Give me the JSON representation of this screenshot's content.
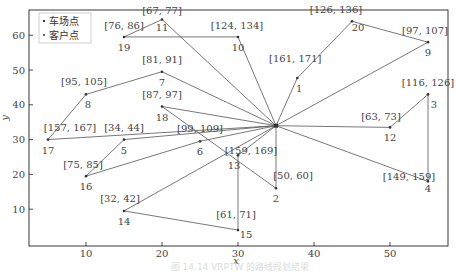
{
  "chart_data": {
    "type": "scatter",
    "subtype": "vehicle-routing-plot",
    "title": "",
    "xlabel": "x",
    "ylabel": "y",
    "xlim": [
      0,
      57
    ],
    "ylim": [
      2,
      67
    ],
    "xticks": [
      10,
      20,
      30,
      40,
      50
    ],
    "yticks": [
      10,
      20,
      30,
      40,
      50,
      60
    ],
    "grid": false,
    "legend_position": "upper-left",
    "legend": [
      {
        "label": "车场点",
        "marker": "square"
      },
      {
        "label": "客户点",
        "marker": "dot"
      }
    ],
    "depot": {
      "id": "depot",
      "x": 35,
      "y": 34
    },
    "customers": [
      {
        "id": "1",
        "x": 37.8,
        "y": 47.7,
        "tw": "[161, 171]"
      },
      {
        "id": "2",
        "x": 35,
        "y": 16,
        "tw": "[50, 60]"
      },
      {
        "id": "3",
        "x": 55,
        "y": 43,
        "tw": "[116, 126]"
      },
      {
        "id": "4",
        "x": 55,
        "y": 18,
        "tw": "[149, 159]"
      },
      {
        "id": "5",
        "x": 15,
        "y": 30,
        "tw": "[34, 44]"
      },
      {
        "id": "6",
        "x": 25,
        "y": 29.5,
        "tw": "[99, 109]"
      },
      {
        "id": "7",
        "x": 20,
        "y": 49.5,
        "tw": "[81, 91]"
      },
      {
        "id": "8",
        "x": 10,
        "y": 43,
        "tw": "[95, 105]"
      },
      {
        "id": "9",
        "x": 55,
        "y": 58,
        "tw": "[97, 107]"
      },
      {
        "id": "10",
        "x": 30,
        "y": 59.5,
        "tw": "[124, 134]"
      },
      {
        "id": "11",
        "x": 20,
        "y": 64.5,
        "tw": "[67, 77]"
      },
      {
        "id": "12",
        "x": 50,
        "y": 33.5,
        "tw": "[63, 73]"
      },
      {
        "id": "13",
        "x": 30,
        "y": 25.5,
        "tw": "[159, 169]"
      },
      {
        "id": "14",
        "x": 15,
        "y": 9.5,
        "tw": "[32, 42]"
      },
      {
        "id": "15",
        "x": 30,
        "y": 4,
        "tw": "[61, 71]"
      },
      {
        "id": "16",
        "x": 10,
        "y": 19.5,
        "tw": "[75, 85]"
      },
      {
        "id": "17",
        "x": 5,
        "y": 30,
        "tw": "[157, 167]"
      },
      {
        "id": "18",
        "x": 20,
        "y": 39.5,
        "tw": "[87, 97]"
      },
      {
        "id": "19",
        "x": 15,
        "y": 59.5,
        "tw": "[76, 86]"
      },
      {
        "id": "20",
        "x": 45,
        "y": 64,
        "tw": "[126, 136]"
      }
    ],
    "routes": [
      [
        "depot",
        "17",
        "8",
        "7",
        "depot"
      ],
      [
        "depot",
        "5",
        "16",
        "6",
        "depot"
      ],
      [
        "depot",
        "18",
        "2",
        "depot"
      ],
      [
        "depot",
        "13",
        "15",
        "14",
        "depot"
      ],
      [
        "depot",
        "11",
        "19",
        "10",
        "depot"
      ],
      [
        "depot",
        "1",
        "20",
        "9",
        "depot"
      ],
      [
        "depot",
        "12",
        "3",
        "4",
        "depot"
      ]
    ]
  },
  "labels": {
    "xlabel": "x",
    "ylabel": "y",
    "legend_depot": "车场点",
    "legend_customer": "客户点",
    "caption": "图 14.14  VRPTW 的路线规划结果"
  },
  "colors": {
    "line": "#555555",
    "marker": "#333333",
    "frame": "#222222",
    "text": "#444444"
  }
}
